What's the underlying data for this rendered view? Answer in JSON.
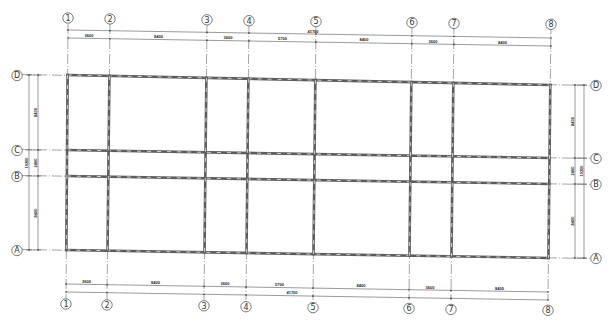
{
  "drawing": {
    "type": "structural-grid-plan",
    "line_color": "#5c5c5c",
    "background": "#ffffff"
  },
  "columns": [
    {
      "label": "①",
      "id": "1",
      "x_top": 68,
      "x_bot": 66
    },
    {
      "label": "②",
      "id": "2",
      "x_top": 110,
      "x_bot": 107
    },
    {
      "label": "③",
      "id": "3",
      "x_top": 207,
      "x_bot": 204
    },
    {
      "label": "④",
      "id": "4",
      "x_top": 249,
      "x_bot": 246
    },
    {
      "label": "⑤",
      "id": "5",
      "x_top": 316,
      "x_bot": 313
    },
    {
      "label": "⑥",
      "id": "6",
      "x_top": 412,
      "x_bot": 409
    },
    {
      "label": "⑦",
      "id": "7",
      "x_top": 454,
      "x_bot": 451
    },
    {
      "label": "⑧",
      "id": "8",
      "x_top": 551,
      "x_bot": 548
    }
  ],
  "rows": [
    {
      "label": "Ⓓ",
      "id": "D",
      "y_left": 75,
      "y_right": 85
    },
    {
      "label": "Ⓒ",
      "id": "C",
      "y_left": 150,
      "y_right": 158
    },
    {
      "label": "Ⓑ",
      "id": "B",
      "y_left": 176,
      "y_right": 184
    },
    {
      "label": "Ⓐ",
      "id": "A",
      "y_left": 250,
      "y_right": 258
    }
  ],
  "dimensions": {
    "top": {
      "segments": [
        "3600",
        "8400",
        "3600",
        "5700",
        "8400",
        "3600",
        "8400"
      ],
      "total": "41700"
    },
    "bottom": {
      "segments": [
        "3600",
        "8400",
        "3600",
        "5700",
        "8400",
        "3600",
        "8400"
      ],
      "total": "41700"
    },
    "left": {
      "segments": [
        "8400",
        "2400",
        "8400"
      ],
      "total": "19200"
    },
    "right": {
      "segments": [
        "8400",
        "2400",
        "8400"
      ],
      "total": "19200"
    }
  }
}
